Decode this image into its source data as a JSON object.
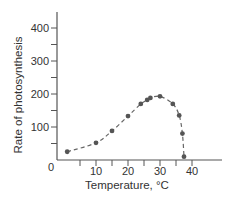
{
  "chart_data": {
    "type": "line",
    "title": "",
    "xlabel": "Temperature, °C",
    "ylabel": "Rate of photosynthesis",
    "xlim": [
      -2,
      50
    ],
    "ylim": [
      0,
      440
    ],
    "x_ticks": [
      0,
      10,
      20,
      30,
      40
    ],
    "x_tick_labels": [
      "0",
      "10",
      "20",
      "30",
      "40"
    ],
    "y_ticks": [
      100,
      200,
      300,
      400
    ],
    "y_tick_labels": [
      "100",
      "200",
      "300",
      "400"
    ],
    "grid": false,
    "legend": null,
    "line_style": "dashed",
    "marker": "circle",
    "series": [
      {
        "name": "Rate of photosynthesis",
        "x": [
          1,
          10,
          15,
          20,
          24,
          26,
          27,
          30,
          34,
          36,
          37,
          37.5
        ],
        "y": [
          25,
          52,
          88,
          133,
          170,
          182,
          188,
          193,
          170,
          135,
          80,
          10
        ]
      }
    ],
    "colors": {
      "axis": "#555555",
      "line": "#666666",
      "marker": "#555555",
      "text": "#333333"
    }
  }
}
